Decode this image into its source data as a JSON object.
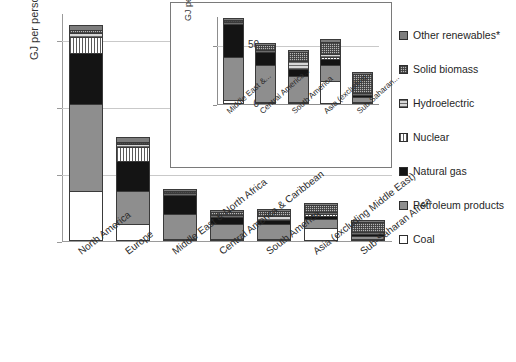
{
  "chart_data": {
    "type": "bar",
    "title": "",
    "subtitle": "",
    "xlabel": "",
    "ylabel": "GJ per person-year",
    "ylim": [
      0,
      340
    ],
    "yticks": [
      0,
      100,
      200,
      300
    ],
    "grid": true,
    "stacked": true,
    "legend_position": "right",
    "categories": [
      "North America",
      "Europe",
      "Middle East & North Africa",
      "Central America & Caribbean",
      "South America",
      "Asia (excluding Middle East)",
      "Sub-Saharan Africa"
    ],
    "series": [
      {
        "name": "Coal",
        "values": [
          75,
          25,
          3,
          2,
          2,
          20,
          2
        ]
      },
      {
        "name": "Petroleum products",
        "values": [
          130,
          50,
          37,
          22,
          22,
          13,
          4
        ]
      },
      {
        "name": "Natural gas",
        "values": [
          75,
          45,
          28,
          11,
          6,
          5,
          1
        ]
      },
      {
        "name": "Nuclear",
        "values": [
          25,
          20,
          0,
          0,
          0,
          1,
          0
        ]
      },
      {
        "name": "Hydroelectric",
        "values": [
          5,
          4,
          1,
          2,
          7,
          3,
          1
        ]
      },
      {
        "name": "Solid biomass",
        "values": [
          5,
          4,
          1,
          4,
          7,
          10,
          16
        ]
      },
      {
        "name": "Other renewables*",
        "values": [
          7,
          7,
          1,
          2,
          2,
          3,
          1
        ]
      }
    ],
    "inset": {
      "type": "bar",
      "stacked": true,
      "ylabel": "GJ per person-year",
      "ylim": [
        0,
        75
      ],
      "yticks": [
        0,
        50
      ],
      "grid": true,
      "categories": [
        "Middle East &...",
        "Central America...",
        "South America",
        "Asia (excluding...",
        "Sub-Saharan..."
      ],
      "series": [
        {
          "name": "Coal",
          "values": [
            3,
            2,
            2,
            20,
            2
          ]
        },
        {
          "name": "Petroleum products",
          "values": [
            37,
            31,
            22,
            13,
            4
          ]
        },
        {
          "name": "Natural gas",
          "values": [
            28,
            11,
            6,
            5,
            1
          ]
        },
        {
          "name": "Nuclear",
          "values": [
            0,
            0,
            0,
            1,
            0
          ]
        },
        {
          "name": "Hydroelectric",
          "values": [
            1,
            2,
            7,
            3,
            1
          ]
        },
        {
          "name": "Solid biomass",
          "values": [
            1,
            4,
            7,
            10,
            16
          ]
        },
        {
          "name": "Other renewables*",
          "values": [
            1,
            2,
            2,
            3,
            1
          ]
        }
      ]
    }
  },
  "legend": {
    "items": [
      {
        "label": "Other renewables*",
        "swatch": "renewables-swatch"
      },
      {
        "label": "Solid biomass",
        "swatch": "biomass-swatch"
      },
      {
        "label": "Hydroelectric",
        "swatch": "hydro-swatch"
      },
      {
        "label": "Nuclear",
        "swatch": "nuclear-swatch"
      },
      {
        "label": "Natural gas",
        "swatch": "gas-swatch"
      },
      {
        "label": "Petroleum products",
        "swatch": "petroleum-swatch"
      },
      {
        "label": "Coal",
        "swatch": "coal-swatch"
      }
    ]
  },
  "axes": {
    "main": {
      "ylabel": "GJ per person-year",
      "tick_0": "0",
      "tick_100": "100",
      "tick_200": "200",
      "tick_300": "300"
    },
    "inset": {
      "ylabel": "GJ per person-year",
      "tick_0": "0",
      "tick_50": "50"
    }
  },
  "colors": {
    "coal": "#ffffff",
    "petroleum": "#8e8e8e",
    "natural_gas": "#141414",
    "nuclear": "#ffffff",
    "hydroelectric": "#d8d8d8",
    "solid_biomass": "#b8b8b8",
    "other_renewables": "#7d7d7d",
    "grid": "#c9c9c9",
    "axis": "#9a9a9a",
    "outline": "#3a3a3a"
  }
}
